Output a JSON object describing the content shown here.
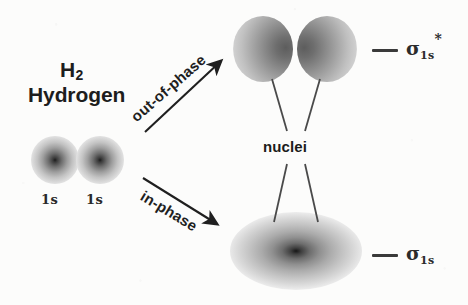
{
  "figure": {
    "title_formula": "H",
    "title_formula_subscript": "2",
    "title_name": "Hydrogen",
    "background_color": "#fcfcfb",
    "ink_color": "#1d1d1d"
  },
  "atomic_orbitals": {
    "left": {
      "label": "1s"
    },
    "right": {
      "label": "1s"
    }
  },
  "arrows": [
    {
      "label": "out-of-phase",
      "direction": "up-right"
    },
    {
      "label": "in-phase",
      "direction": "down-right"
    }
  ],
  "molecular_orbitals": {
    "antibonding": {
      "name": "sigma-1s-antibonding",
      "lobes": 2,
      "nodal_plane": true
    },
    "bonding": {
      "name": "sigma-1s-bonding",
      "lobes": 1,
      "nodal_plane": false
    }
  },
  "annotations": {
    "nuclei_label": "nuclei",
    "leader_lines": 4
  },
  "energy_levels": [
    {
      "id": "antibonding",
      "symbol": "σ",
      "superscript": "*",
      "subscript": "1s"
    },
    {
      "id": "bonding",
      "symbol": "σ",
      "superscript": "",
      "subscript": "1s"
    }
  ]
}
